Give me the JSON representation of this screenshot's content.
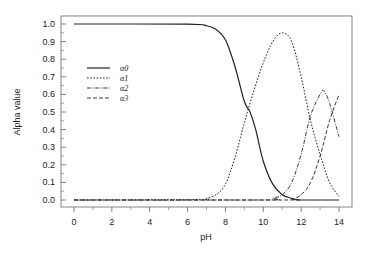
{
  "chart_data": {
    "type": "line",
    "title": "",
    "xlabel": "pH",
    "ylabel": "Alpha value",
    "xlim": [
      0,
      14
    ],
    "ylim": [
      0.0,
      1.0
    ],
    "xticks": [
      0,
      2,
      4,
      6,
      8,
      10,
      12,
      14
    ],
    "yticks": [
      0.0,
      0.1,
      0.2,
      0.3,
      0.4,
      0.5,
      0.6,
      0.7,
      0.8,
      0.9,
      1.0
    ],
    "grid": false,
    "legend_position": "upper-left (inside)",
    "note": "Values are digitized estimates read off the printed figure, not outputs of a fitted equilibrium model.",
    "series": [
      {
        "name": "α0",
        "style": "solid",
        "x": [
          0,
          6,
          7,
          7.5,
          8,
          8.5,
          9,
          9.3,
          9.6,
          10,
          10.5,
          11,
          11.5,
          12,
          14
        ],
        "values": [
          1.0,
          0.999,
          0.99,
          0.97,
          0.91,
          0.76,
          0.56,
          0.5,
          0.4,
          0.22,
          0.09,
          0.03,
          0.01,
          0.0,
          0.0
        ]
      },
      {
        "name": "α1",
        "style": "dotted",
        "x": [
          0,
          6.5,
          7,
          7.5,
          8,
          8.5,
          9,
          9.5,
          10,
          10.5,
          11,
          11.5,
          12,
          12.5,
          13,
          13.5,
          14
        ],
        "values": [
          0.0,
          0.002,
          0.01,
          0.03,
          0.09,
          0.24,
          0.44,
          0.62,
          0.78,
          0.9,
          0.95,
          0.9,
          0.7,
          0.45,
          0.26,
          0.1,
          0.02
        ]
      },
      {
        "name": "α2",
        "style": "dash-dot",
        "x": [
          0,
          10,
          10.5,
          11,
          11.5,
          12,
          12.5,
          13,
          13.2,
          13.5,
          14
        ],
        "values": [
          0.0,
          0.0,
          0.01,
          0.03,
          0.1,
          0.26,
          0.48,
          0.6,
          0.62,
          0.55,
          0.36
        ]
      },
      {
        "name": "α3",
        "style": "dashed",
        "x": [
          0,
          11,
          11.5,
          12,
          12.5,
          13,
          13.5,
          14
        ],
        "values": [
          0.0,
          0.0,
          0.005,
          0.03,
          0.1,
          0.25,
          0.45,
          0.6
        ]
      }
    ]
  }
}
